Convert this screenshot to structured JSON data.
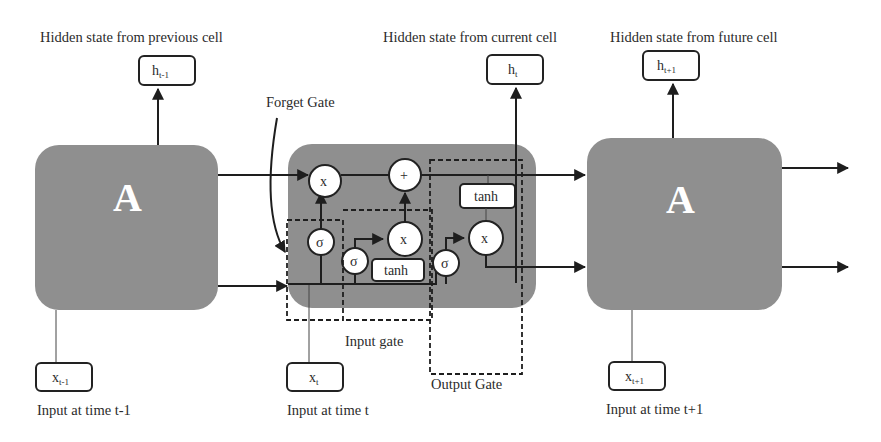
{
  "diagram": {
    "type": "LSTM unrolled cells",
    "top_labels": {
      "prev": "Hidden state from previous cell",
      "current": "Hidden state from current cell",
      "future": "Hidden state from future cell"
    },
    "hidden_states": {
      "prev": {
        "base": "h",
        "sub": "t-1"
      },
      "current": {
        "base": "h",
        "sub": "t"
      },
      "future": {
        "base": "h",
        "sub": "t+1"
      }
    },
    "inputs": {
      "prev": {
        "base": "x",
        "sub": "t-1"
      },
      "current": {
        "base": "x",
        "sub": "t"
      },
      "future": {
        "base": "x",
        "sub": "t+1"
      }
    },
    "bottom_labels": {
      "prev": "Input at time t-1",
      "current": "Input at time t",
      "future": "Input at time t+1"
    },
    "cells": {
      "left": "A",
      "right": "A"
    },
    "gate_labels": {
      "forget": "Forget Gate",
      "input": "Input gate",
      "output": "Output Gate"
    },
    "ops": {
      "multiply": "x",
      "add": "+",
      "sigmoid": "σ",
      "tanh": "tanh"
    },
    "colors": {
      "cell_fill": "#8f8f8f",
      "line": "#1e1e1e",
      "node_fill": "#ffffff",
      "text": "#2b2b2b"
    }
  }
}
